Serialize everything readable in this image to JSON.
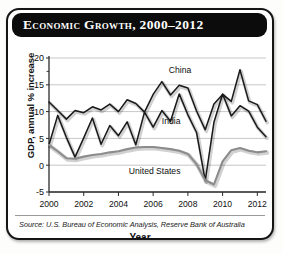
{
  "card": {
    "title": "Economic Growth, 2000–2012",
    "source": "Source: U.S. Bureau of Economic Analysis, Reserve Bank of Australia",
    "colors": {
      "title_bar": "#0c0c0c",
      "title_text": "#ffffff",
      "card_border": "#151515",
      "plot_background": "#ffffff",
      "gridline": "#b9b9b9",
      "axis": "#2b2b2b",
      "china_line": "#1a1a1a",
      "india_line": "#1a1a1a",
      "united_states_line": "#8c8c8c"
    }
  },
  "chart_data": {
    "type": "line",
    "title": "Economic Growth, 2000–2012",
    "xlabel": "Year",
    "ylabel": "GDP, annual % increase",
    "xlim": [
      2000,
      2012.5
    ],
    "ylim": [
      -5,
      20
    ],
    "yticks": [
      -5,
      0,
      5,
      10,
      15,
      20
    ],
    "ytick_labels": [
      "-5",
      "0",
      "5",
      "10",
      "15",
      "20"
    ],
    "xticks": [
      2000,
      2002,
      2004,
      2006,
      2008,
      2010,
      2012
    ],
    "xtick_labels": [
      "2000",
      "2002",
      "2004",
      "2006",
      "2008",
      "2010",
      "2012"
    ],
    "grid": "horizontal",
    "legend": "inline-annotations",
    "annotations": [
      {
        "label": "China",
        "x": 2006.9,
        "y": 17.2
      },
      {
        "label": "India",
        "x": 2006.5,
        "y": 7.6
      },
      {
        "label": "United States",
        "x": 2004.6,
        "y": -1.6
      }
    ],
    "x": [
      2000,
      2000.5,
      2001,
      2001.5,
      2002,
      2002.5,
      2003,
      2003.5,
      2004,
      2004.5,
      2005,
      2005.5,
      2006,
      2006.5,
      2007,
      2007.5,
      2008,
      2008.5,
      2009,
      2009.5,
      2010,
      2010.5,
      2011,
      2011.5,
      2012,
      2012.5
    ],
    "series": [
      {
        "name": "China",
        "values": [
          11.8,
          10.2,
          8.6,
          10.2,
          9.8,
          10.9,
          10.3,
          11.4,
          10.0,
          12.2,
          11.5,
          9.9,
          13.2,
          15.6,
          13.1,
          14.9,
          14.4,
          10.1,
          6.6,
          11.4,
          13.2,
          11.9,
          17.8,
          12.0,
          11.3,
          8.2
        ]
      },
      {
        "name": "India",
        "values": [
          3.8,
          9.3,
          5.2,
          1.5,
          5.1,
          8.8,
          3.9,
          7.4,
          5.5,
          8.1,
          3.8,
          9.9,
          7.1,
          10.2,
          8.2,
          13.3,
          9.4,
          6.1,
          -2.9,
          8.0,
          13.3,
          9.2,
          11.1,
          10.1,
          7.1,
          5.3
        ]
      },
      {
        "name": "United States",
        "values": [
          3.8,
          2.6,
          1.3,
          1.2,
          1.6,
          1.9,
          2.1,
          2.4,
          2.6,
          3.0,
          3.3,
          3.4,
          3.4,
          3.2,
          3.0,
          2.7,
          2.1,
          0.2,
          -2.8,
          -3.6,
          0.7,
          2.8,
          3.2,
          2.7,
          2.4,
          2.6
        ]
      }
    ]
  }
}
